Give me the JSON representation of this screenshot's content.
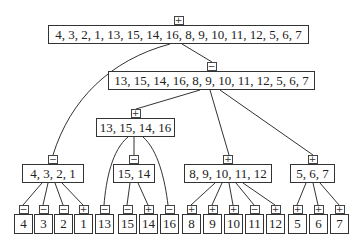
{
  "diagram": {
    "type": "tree",
    "nodes": [
      {
        "id": "root",
        "label": "4, 3, 2, 1, 13, 15, 14, 16, 8, 9, 10, 11, 12, 5, 6, 7",
        "sign": "+",
        "x": 48,
        "y": 25,
        "w": 261,
        "h": 19
      },
      {
        "id": "n2",
        "label": "13, 15, 14, 16, 8, 9, 10, 11, 12, 5, 6, 7",
        "sign": "−",
        "x": 108,
        "y": 71,
        "w": 207,
        "h": 19
      },
      {
        "id": "n3",
        "label": "13, 15, 14, 16",
        "sign": "+",
        "x": 96,
        "y": 118,
        "w": 79,
        "h": 19
      },
      {
        "id": "n4",
        "label": "4, 3, 2, 1",
        "sign": "−",
        "x": 22,
        "y": 164,
        "w": 62,
        "h": 19
      },
      {
        "id": "n5",
        "label": "15, 14",
        "sign": "−",
        "x": 113,
        "y": 164,
        "w": 42,
        "h": 19
      },
      {
        "id": "n6",
        "label": "8, 9, 10, 11, 12",
        "sign": "+",
        "x": 184,
        "y": 164,
        "w": 88,
        "h": 19
      },
      {
        "id": "n7",
        "label": "5, 6, 7",
        "sign": "+",
        "x": 290,
        "y": 164,
        "w": 45,
        "h": 19
      }
    ],
    "leaves": [
      {
        "label": "4",
        "sign": "−",
        "x": 14
      },
      {
        "label": "3",
        "sign": "−",
        "x": 34
      },
      {
        "label": "2",
        "sign": "−",
        "x": 54
      },
      {
        "label": "1",
        "sign": "+",
        "x": 74
      },
      {
        "label": "13",
        "sign": "−",
        "x": 95
      },
      {
        "label": "15",
        "sign": "−",
        "x": 118
      },
      {
        "label": "14",
        "sign": "+",
        "x": 139
      },
      {
        "label": "16",
        "sign": "−",
        "x": 160
      },
      {
        "label": "8",
        "sign": "+",
        "x": 182
      },
      {
        "label": "9",
        "sign": "+",
        "x": 203
      },
      {
        "label": "10",
        "sign": "+",
        "x": 224
      },
      {
        "label": "11",
        "sign": "−",
        "x": 245
      },
      {
        "label": "12",
        "sign": "+",
        "x": 266
      },
      {
        "label": "5",
        "sign": "+",
        "x": 288
      },
      {
        "label": "6",
        "sign": "+",
        "x": 309
      },
      {
        "label": "7",
        "sign": "+",
        "x": 330
      }
    ],
    "leaf_y": 214,
    "leaf_w": 19,
    "leaf_h": 20
  }
}
